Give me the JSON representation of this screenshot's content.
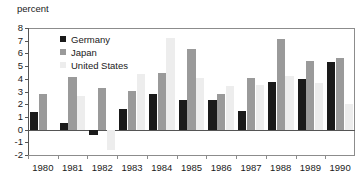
{
  "chart_data": {
    "type": "bar",
    "title": "",
    "subtitle": "",
    "xlabel": "",
    "ylabel": "percent",
    "categories": [
      "1980",
      "1981",
      "1982",
      "1983",
      "1984",
      "1985",
      "1986",
      "1987",
      "1988",
      "1989",
      "1990"
    ],
    "series": [
      {
        "name": "Germany",
        "color": "#1a1a1a",
        "values": [
          1.4,
          0.55,
          -0.4,
          1.6,
          2.8,
          2.35,
          2.35,
          1.45,
          3.75,
          3.95,
          5.3
        ]
      },
      {
        "name": "Japan",
        "color": "#9a9a9a",
        "values": [
          2.8,
          4.15,
          3.3,
          3.05,
          4.45,
          6.35,
          2.8,
          4.1,
          7.1,
          5.4,
          5.6
        ]
      },
      {
        "name": "United States",
        "color": "#ededed",
        "values": [
          0.0,
          2.65,
          -1.6,
          4.4,
          7.2,
          4.1,
          3.4,
          3.5,
          4.2,
          3.7,
          2.05
        ]
      }
    ],
    "ylim": [
      -2,
      8
    ],
    "yticks": [
      "8",
      "7",
      "6",
      "5",
      "4",
      "3",
      "2",
      "1",
      "0",
      "-1",
      "-2"
    ],
    "ytick_values": [
      8,
      7,
      6,
      5,
      4,
      3,
      2,
      1,
      0,
      -1,
      -2
    ],
    "grid": false,
    "legend_position": "top-left",
    "legend": [
      "Germany",
      "Japan",
      "United States"
    ]
  }
}
